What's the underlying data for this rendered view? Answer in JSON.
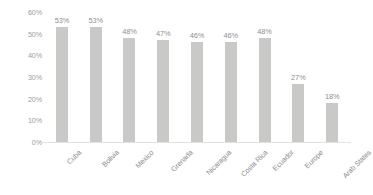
{
  "chart_data": {
    "type": "bar",
    "title": "",
    "subtitle": "",
    "xlabel": "",
    "ylabel": "",
    "ylim": [
      0,
      60
    ],
    "grid": false,
    "legend": null,
    "legend_position": "none",
    "axis_tick_suffix": "%",
    "categories": [
      "Cuba",
      "Bolivia",
      "Mexico",
      "Grenada",
      "Nicaragua",
      "Costa Rica",
      "Ecuador",
      "Europe",
      "Arab States"
    ],
    "values": [
      53,
      53,
      48,
      47,
      46,
      46,
      48,
      27,
      18
    ],
    "data_labels": [
      "53%",
      "53%",
      "48%",
      "47%",
      "46%",
      "46%",
      "48%",
      "27%",
      "18%"
    ],
    "y_ticks": [
      0,
      10,
      20,
      30,
      40,
      50,
      60
    ],
    "y_tick_labels": [
      "0%",
      "10%",
      "20%",
      "30%",
      "40%",
      "50%",
      "60%"
    ],
    "colors": {
      "bar": "#c9c9c7",
      "data_label": "#8f8f8f",
      "tick_label": "#9c9c9c",
      "category_label": "#8a8a8a",
      "axis_line": "#e2e2e2",
      "background": "#ffffff"
    }
  }
}
